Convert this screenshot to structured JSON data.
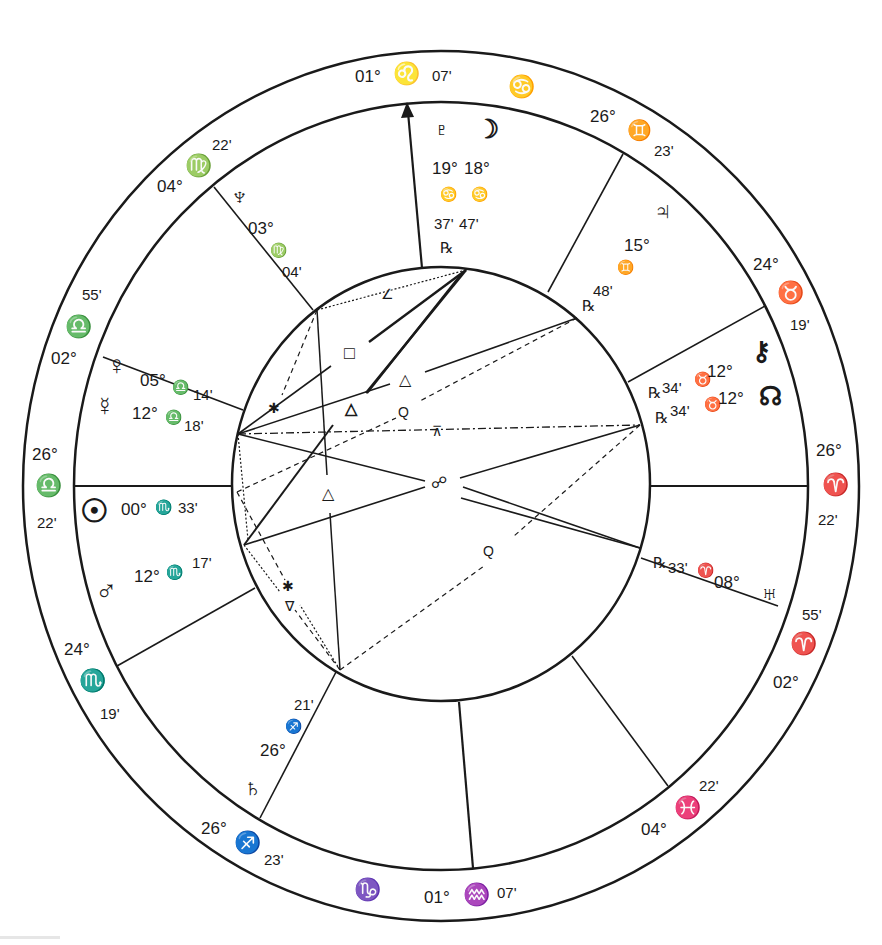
{
  "chart": {
    "type": "natal-wheel",
    "colors": {
      "line": "#1a1a1a",
      "grey_sign": "#7a7a7a",
      "background": "#ffffff"
    },
    "geometry": {
      "center": [
        441,
        486
      ],
      "outer": {
        "rx": 418,
        "ry": 435
      },
      "middle": {
        "rx": 367,
        "ry": 384
      },
      "inner": {
        "rx": 209,
        "ry": 217
      }
    }
  },
  "house_cusps": [
    {
      "id": "mc",
      "deg": "01°",
      "sign": "♌",
      "min": "07'"
    },
    {
      "id": "h11",
      "deg": "26°",
      "sign": "♊",
      "min": "23'"
    },
    {
      "id": "h12",
      "deg": "24°",
      "sign": "♉",
      "min": "19'"
    },
    {
      "id": "asc-right",
      "deg": "26°",
      "sign": "♈",
      "min": "22'"
    },
    {
      "id": "h2r",
      "deg": "02°",
      "sign": "♈",
      "min": "55'"
    },
    {
      "id": "h3r",
      "deg": "04°",
      "sign": "♓",
      "min": "22'"
    },
    {
      "id": "ic",
      "deg": "01°",
      "sign": "♒",
      "min": "07'"
    },
    {
      "id": "h5",
      "deg": "26°",
      "sign": "♐",
      "min": "23'"
    },
    {
      "id": "h6",
      "deg": "24°",
      "sign": "♏",
      "min": "19'"
    },
    {
      "id": "asc",
      "deg": "26°",
      "sign": "♎",
      "min": "22'"
    },
    {
      "id": "h8",
      "deg": "02°",
      "sign": "♎",
      "min": "55'"
    },
    {
      "id": "h9",
      "deg": "04°",
      "sign": "♍",
      "min": "22'"
    }
  ],
  "intercepted_signs": [
    {
      "id": "cancer",
      "sign": "♋"
    },
    {
      "id": "capricorn",
      "sign": "♑"
    }
  ],
  "planets": [
    {
      "id": "pluto",
      "glyph": "♇",
      "deg": "19°",
      "sign": "♋",
      "min": "37'",
      "rx": "℞"
    },
    {
      "id": "moon",
      "glyph": "☽",
      "deg": "18°",
      "sign": "♋",
      "min": "47'"
    },
    {
      "id": "jupiter",
      "glyph": "♃",
      "deg": "15°",
      "sign": "♊",
      "min": "48'",
      "rx": "℞"
    },
    {
      "id": "chiron",
      "glyph": "⚷",
      "deg": "12°",
      "sign": "♉",
      "min": "34'",
      "rx": "℞"
    },
    {
      "id": "node",
      "glyph": "☊",
      "deg": "12°",
      "sign": "♉",
      "min": "34'",
      "rx": "℞"
    },
    {
      "id": "uranus",
      "glyph": "♅",
      "deg": "08°",
      "sign": "♈",
      "min": "33'",
      "rx": "℞"
    },
    {
      "id": "saturn",
      "glyph": "♄",
      "deg": "26°",
      "sign": "♐",
      "min": "21'"
    },
    {
      "id": "mars",
      "glyph": "♂",
      "deg": "12°",
      "sign": "♏",
      "min": "17'"
    },
    {
      "id": "sun",
      "glyph": "☉",
      "deg": "00°",
      "sign": "♏",
      "min": "33'"
    },
    {
      "id": "mercury",
      "glyph": "☿",
      "deg": "12°",
      "sign": "♎",
      "min": "18'"
    },
    {
      "id": "venus",
      "glyph": "♀",
      "deg": "05°",
      "sign": "♎",
      "min": "14'"
    },
    {
      "id": "neptune",
      "glyph": "♆",
      "deg": "03°",
      "sign": "♍",
      "min": "04'"
    }
  ],
  "aspect_symbols": {
    "square": "□",
    "trine": "△",
    "sextile": "✱",
    "quincunx": "⊼",
    "semisquare": "∠",
    "sesquiquadrate": "Q",
    "quintile": "∇",
    "opposition": "☍"
  }
}
